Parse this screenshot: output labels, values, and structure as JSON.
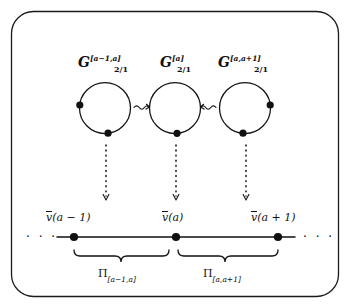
{
  "figure": {
    "kind": "mathematical-diagram",
    "border": {
      "shape": "rounded-rectangle",
      "color": "#1a1a1a"
    },
    "ink_color": "#111111",
    "background": "#ffffff"
  },
  "group_labels": [
    {
      "id": "g-left",
      "base": "G",
      "subscript": "2/1",
      "superscript": "[a−1,a]"
    },
    {
      "id": "g-middle",
      "base": "G",
      "subscript": "2/1",
      "superscript": "[a]"
    },
    {
      "id": "g-right",
      "base": "G",
      "subscript": "2/1",
      "superscript": "[a,a+1]"
    }
  ],
  "circles": [
    {
      "id": "circle-left",
      "marked_points": [
        "west",
        "south"
      ]
    },
    {
      "id": "circle-middle",
      "marked_points": [
        "south"
      ]
    },
    {
      "id": "circle-right",
      "marked_points": [
        "east",
        "south"
      ]
    }
  ],
  "squiggly_arrows": [
    {
      "id": "squiggle-left-to-middle",
      "direction": "right",
      "glyph": "⇝"
    },
    {
      "id": "squiggle-right-to-middle",
      "direction": "left",
      "glyph": "⇜"
    }
  ],
  "dotted_arrows": [
    {
      "id": "dotted-arrow-left",
      "direction": "down"
    },
    {
      "id": "dotted-arrow-middle",
      "direction": "down"
    },
    {
      "id": "dotted-arrow-right",
      "direction": "down"
    }
  ],
  "number_line": {
    "left_ellipsis": "· · ·",
    "right_ellipsis": "· · ·",
    "nodes": [
      {
        "id": "node-a-minus-1",
        "label_base": "v",
        "label_arg": "(a − 1)"
      },
      {
        "id": "node-a",
        "label_base": "v",
        "label_arg": "(a)"
      },
      {
        "id": "node-a-plus-1",
        "label_base": "v",
        "label_arg": "(a + 1)"
      }
    ]
  },
  "braces": [
    {
      "id": "brace-left",
      "base": "Π",
      "subscript": "[a−1,a]"
    },
    {
      "id": "brace-right",
      "base": "Π",
      "subscript": "[a,a+1]"
    }
  ]
}
